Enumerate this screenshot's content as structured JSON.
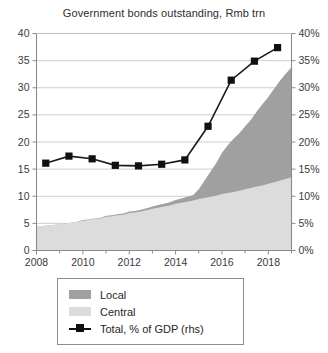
{
  "chart_data": {
    "type": "area",
    "title": "Government bonds outstanding, Rmb trn",
    "xlabel": "",
    "ylabel": "",
    "y2label": "",
    "grid": true,
    "legend_position": "bottom",
    "ylim": [
      0,
      40
    ],
    "y2lim": [
      0,
      40
    ],
    "yticks": [
      "0",
      "5",
      "10",
      "15",
      "20",
      "25",
      "30",
      "35",
      "40"
    ],
    "y2ticks": [
      "0%",
      "5%",
      "10%",
      "15%",
      "20%",
      "25%",
      "30%",
      "35%",
      "40%"
    ],
    "xlim": [
      2008,
      2019
    ],
    "xticks": [
      "2008",
      "2010",
      "2012",
      "2014",
      "2016",
      "2018"
    ],
    "xtick_values": [
      2008,
      2010,
      2012,
      2014,
      2016,
      2018
    ],
    "x_minor_values": [
      2009,
      2011,
      2013,
      2015,
      2017,
      2019
    ],
    "x": [
      2008.0,
      2008.25,
      2008.5,
      2008.75,
      2009.0,
      2009.25,
      2009.5,
      2009.75,
      2010.0,
      2010.25,
      2010.5,
      2010.75,
      2011.0,
      2011.25,
      2011.5,
      2011.75,
      2012.0,
      2012.25,
      2012.5,
      2012.75,
      2013.0,
      2013.25,
      2013.5,
      2013.75,
      2014.0,
      2014.25,
      2014.5,
      2014.75,
      2015.0,
      2015.25,
      2015.5,
      2015.75,
      2016.0,
      2016.25,
      2016.5,
      2016.75,
      2017.0,
      2017.25,
      2017.5,
      2017.75,
      2018.0,
      2018.25,
      2018.5,
      2018.75,
      2019.0
    ],
    "series": [
      {
        "name": "Central",
        "type": "area-stacked",
        "axis": "left",
        "color": "#dcdcdc",
        "values": [
          4.4,
          4.5,
          4.6,
          4.7,
          4.9,
          5.0,
          5.1,
          5.3,
          5.5,
          5.6,
          5.8,
          5.9,
          6.2,
          6.3,
          6.5,
          6.6,
          6.9,
          7.0,
          7.2,
          7.4,
          7.7,
          7.9,
          8.1,
          8.3,
          8.6,
          8.8,
          9.0,
          9.2,
          9.5,
          9.7,
          9.9,
          10.1,
          10.4,
          10.6,
          10.8,
          11.0,
          11.3,
          11.5,
          11.8,
          12.0,
          12.3,
          12.6,
          12.9,
          13.2,
          13.5
        ]
      },
      {
        "name": "Local",
        "type": "area-stacked",
        "axis": "left",
        "color": "#a0a0a0",
        "values": [
          0.0,
          0.0,
          0.0,
          0.0,
          0.0,
          0.0,
          0.0,
          0.0,
          0.1,
          0.1,
          0.1,
          0.1,
          0.2,
          0.2,
          0.2,
          0.2,
          0.3,
          0.3,
          0.3,
          0.4,
          0.4,
          0.5,
          0.5,
          0.6,
          0.7,
          0.8,
          0.9,
          1.0,
          1.8,
          3.2,
          4.6,
          6.0,
          7.6,
          8.8,
          9.8,
          10.6,
          11.6,
          12.6,
          13.8,
          15.0,
          16.0,
          17.2,
          18.4,
          19.4,
          20.3
        ]
      },
      {
        "name": "Total, % of GDP (rhs)",
        "type": "line",
        "axis": "right",
        "color": "#101010",
        "marker": "square",
        "x": [
          2008.4,
          2009.4,
          2010.4,
          2011.4,
          2012.4,
          2013.4,
          2014.4,
          2015.4,
          2016.4,
          2017.4,
          2018.4
        ],
        "values": [
          16.1,
          17.4,
          16.9,
          15.7,
          15.6,
          15.9,
          16.7,
          22.9,
          31.4,
          34.9,
          37.4
        ]
      }
    ]
  },
  "legend": {
    "items": [
      {
        "label": "Local",
        "swatch": "#a0a0a0",
        "kind": "swatch"
      },
      {
        "label": "Central",
        "swatch": "#dcdcdc",
        "kind": "swatch"
      },
      {
        "label": "Total, % of GDP (rhs)",
        "swatch": "#101010",
        "kind": "line-marker"
      }
    ]
  }
}
